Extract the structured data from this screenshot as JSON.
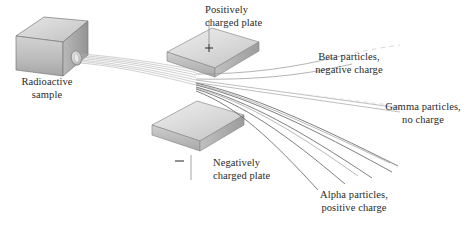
{
  "figure": {
    "background_color": "#ffffff",
    "ink_color": "#2a2a2a"
  },
  "source": {
    "name": "radioactive-sample-block",
    "label_line1": "Radioactive",
    "label_line2": "sample",
    "aperture_name": "beam-aperture"
  },
  "plates": [
    {
      "id": "positive-plate",
      "sign": "+",
      "label_line1": "Positively",
      "label_line2": "charged plate",
      "face_color": "#d9d9d9",
      "edge_color": "#9a9a9a"
    },
    {
      "id": "negative-plate",
      "sign": "–",
      "label_line1": "Negatively",
      "label_line2": "charged plate",
      "face_color": "#d9d9d9",
      "edge_color": "#9a9a9a"
    }
  ],
  "beams": [
    {
      "id": "beta-beam",
      "label_line1": "Beta particles,",
      "label_line2": "negative charge",
      "deflection": "up",
      "charge": "negative",
      "color": "#8e8e8e"
    },
    {
      "id": "gamma-beam",
      "label_line1": "Gamma particles,",
      "label_line2": "no charge",
      "deflection": "none",
      "charge": "none",
      "color": "#b4b4b4"
    },
    {
      "id": "alpha-beam",
      "label_line1": "Alpha particles,",
      "label_line2": "positive charge",
      "deflection": "down",
      "charge": "positive",
      "color": "#6b6b6b"
    }
  ]
}
